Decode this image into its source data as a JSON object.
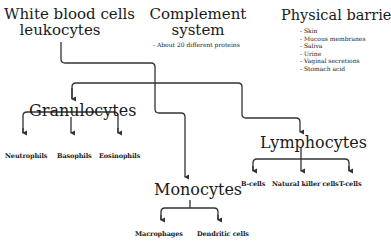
{
  "nodes": {
    "white_blood_cells": {
      "line1": "White blood cells",
      "line2": "leukocytes"
    },
    "complement": {
      "line1": "Complement",
      "line2": "system",
      "note": "- About 20 different proteins"
    },
    "physical_barriers": {
      "title": "Physical barriers",
      "items": [
        "- Skin",
        "- Mucous membranes",
        "- Saliva",
        "- Urine",
        "- Vaginal secretions",
        "- Stomach acid"
      ]
    },
    "granulocytes": {
      "label": "Granulocytes",
      "children": [
        "Neutrophils",
        "Basophils",
        "Eosinophils"
      ]
    },
    "monocytes": {
      "label": "Monocytes",
      "children": [
        "Macrophages",
        "Dendritic cells"
      ]
    },
    "lymphocytes": {
      "label": "Lymphocytes",
      "children": [
        "B-cells",
        "Natural killer cells",
        "T-cells"
      ]
    }
  },
  "colors": {
    "line": "#333333",
    "text": "#1a1a1a"
  }
}
